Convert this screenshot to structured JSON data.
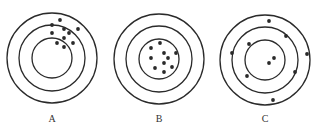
{
  "figure": {
    "colors": {
      "stroke": "#2a2a2a",
      "background": "#ffffff",
      "label": "#333333"
    },
    "targets": [
      {
        "label": "A",
        "center": [
          52,
          58
        ],
        "radii": [
          45,
          33,
          20
        ],
        "dots": [
          [
            60,
            20
          ],
          [
            52,
            25
          ],
          [
            64,
            29
          ],
          [
            69,
            33
          ],
          [
            78,
            29
          ],
          [
            52,
            33
          ],
          [
            64,
            38
          ],
          [
            73,
            43
          ],
          [
            57,
            43
          ],
          [
            64,
            47
          ]
        ]
      },
      {
        "label": "B",
        "center": [
          159,
          59
        ],
        "radii": [
          45,
          33,
          20
        ],
        "dots": [
          [
            160,
            43
          ],
          [
            151,
            48
          ],
          [
            164,
            53
          ],
          [
            176,
            53
          ],
          [
            168,
            58
          ],
          [
            151,
            58
          ],
          [
            164,
            63
          ],
          [
            155,
            68
          ],
          [
            172,
            67
          ],
          [
            164,
            72
          ]
        ]
      },
      {
        "label": "C",
        "center": [
          265,
          60
        ],
        "radii": [
          45,
          33,
          20
        ],
        "dots": [
          [
            269,
            21
          ],
          [
            286,
            36
          ],
          [
            249,
            44
          ],
          [
            232,
            53
          ],
          [
            307,
            54
          ],
          [
            274,
            58
          ],
          [
            269,
            63
          ],
          [
            295,
            72
          ],
          [
            247,
            76
          ],
          [
            273,
            100
          ]
        ]
      }
    ]
  }
}
